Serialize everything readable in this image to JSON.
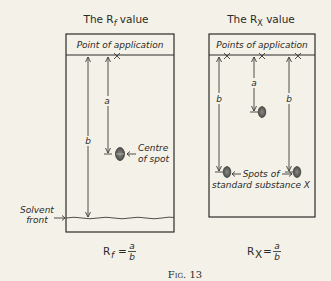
{
  "figure": {
    "caption": "Fig. 13",
    "colors": {
      "background": "#f4f2e8",
      "ink": "#2a2a28",
      "spot": "#6a6a66"
    }
  },
  "left_panel": {
    "title_prefix": "The R",
    "title_sub": "f",
    "title_suffix": " value",
    "header_label": "Point of application",
    "distance_a": "a",
    "distance_b": "b",
    "spot_label_line1": "Centre",
    "spot_label_line2": "of spot",
    "solvent_label_line1": "Solvent",
    "solvent_label_line2": "front",
    "formula_prefix": "R",
    "formula_sub": "f",
    "formula_eq": "=",
    "formula_num": "a",
    "formula_den": "b"
  },
  "right_panel": {
    "title_prefix": "The R",
    "title_sub": "X",
    "title_suffix": " value",
    "header_label": "Points of application",
    "distance_a": "a",
    "distance_b_left": "b",
    "distance_b_right": "b",
    "spots_label_line1": "Spots of",
    "spots_label_line2": "standard substance X",
    "formula_prefix": "R",
    "formula_sub": "X",
    "formula_eq": "=",
    "formula_num": "a",
    "formula_den": "b"
  }
}
